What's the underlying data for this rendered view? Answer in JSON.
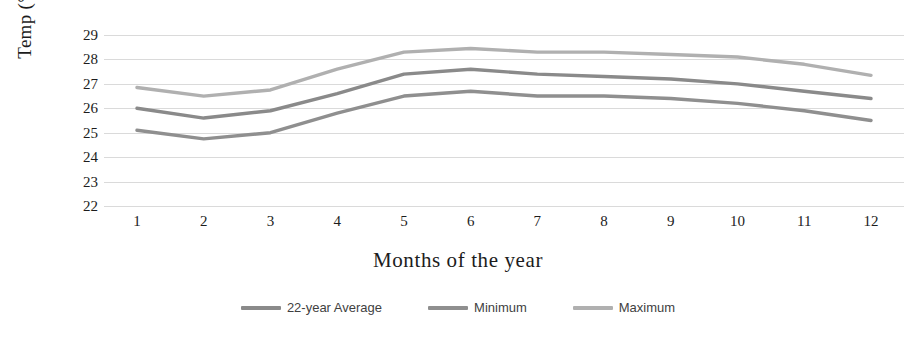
{
  "chart_data": {
    "type": "line",
    "title": "",
    "xlabel": "Months of the year",
    "ylabel": "Temp (°C)",
    "x": [
      1,
      2,
      3,
      4,
      5,
      6,
      7,
      8,
      9,
      10,
      11,
      12
    ],
    "categories": [
      "1",
      "2",
      "3",
      "4",
      "5",
      "6",
      "7",
      "8",
      "9",
      "10",
      "11",
      "12"
    ],
    "xlim": [
      1,
      12
    ],
    "ylim": [
      22,
      29
    ],
    "yticks": [
      22,
      23,
      24,
      25,
      26,
      27,
      28,
      29
    ],
    "ytick_labels": [
      "22",
      "23",
      "24",
      "25",
      "26",
      "27",
      "28",
      "29"
    ],
    "grid": true,
    "grid_axis": "y",
    "legend_position": "bottom",
    "series": [
      {
        "name": "22-year Average",
        "color": "#8a8a8a",
        "values": [
          26.0,
          25.6,
          25.9,
          26.6,
          27.4,
          27.6,
          27.4,
          27.3,
          27.2,
          27.0,
          26.7,
          26.4
        ]
      },
      {
        "name": "Minimum",
        "color": "#8f8f8f",
        "values": [
          25.1,
          24.75,
          25.0,
          25.8,
          26.5,
          26.7,
          26.5,
          26.5,
          26.4,
          26.2,
          25.9,
          25.5
        ]
      },
      {
        "name": "Maximum",
        "color": "#b0b0b0",
        "values": [
          26.85,
          26.5,
          26.75,
          27.6,
          28.3,
          28.45,
          28.3,
          28.3,
          28.2,
          28.1,
          27.8,
          27.35
        ]
      }
    ]
  },
  "axes": {
    "y_title": "Temp (°C)",
    "x_title": "Months of the year"
  },
  "legend": {
    "items": [
      {
        "label": "22-year Average"
      },
      {
        "label": "Minimum"
      },
      {
        "label": "Maximum"
      }
    ]
  }
}
